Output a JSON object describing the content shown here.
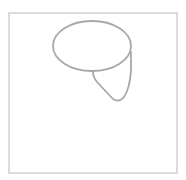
{
  "sketch": {
    "background": "#ffffff",
    "stroke_color": "#a8a8a8",
    "frame": {
      "x": 9,
      "y": 13,
      "width": 168,
      "height": 160,
      "stroke": "#c4c4c4",
      "stroke_width": 1.2
    },
    "shapes": [
      {
        "name": "ellipse",
        "cx": 92,
        "cy": 46,
        "rx": 39,
        "ry": 25
      },
      {
        "name": "teardrop",
        "path": "M93,72 Q93,77 97,82 L113,99 Q119,103 124,97 Q130,88 131,70 L131,52"
      }
    ]
  }
}
